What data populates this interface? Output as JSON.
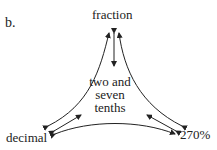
{
  "figure": {
    "panel_label": "b.",
    "nodes": {
      "top": "fraction",
      "left": "decimal",
      "right": "270%"
    },
    "center_lines": [
      "two and",
      "seven",
      "tenths"
    ],
    "colors": {
      "stroke": "#222222",
      "background": "#ffffff"
    }
  }
}
